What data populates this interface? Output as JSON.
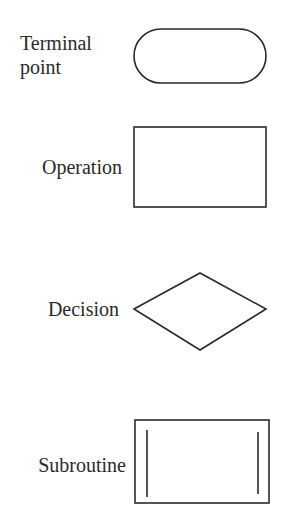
{
  "symbols": [
    {
      "label_line1": "Terminal",
      "label_line2": "point",
      "shape": "rounded-rectangle"
    },
    {
      "label": "Operation",
      "shape": "rectangle"
    },
    {
      "label": "Decision",
      "shape": "diamond"
    },
    {
      "label": "Subroutine",
      "shape": "rectangle-with-side-bars"
    }
  ],
  "colors": {
    "stroke": "#2a2a2a",
    "background": "#ffffff"
  }
}
